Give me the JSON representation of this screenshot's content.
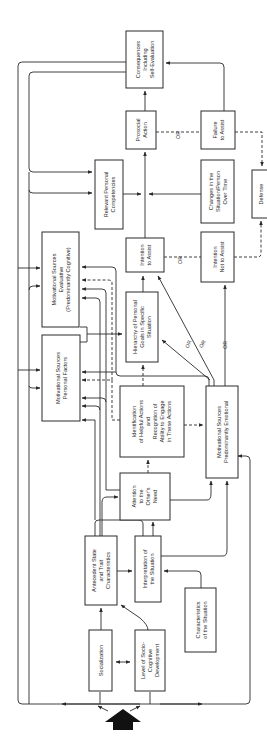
{
  "diagram": {
    "orientation": "rotated 90 degrees (text reads bottom-to-top)",
    "boxes": {
      "consequences": [
        "Consequences",
        "Including",
        "Self-Evaluation"
      ],
      "prosocial_action": [
        "Prosocial",
        "Action"
      ],
      "failure_to_assist": [
        "Failure",
        "to Assist"
      ],
      "relevant_competencies": [
        "Relevant Personal",
        "Competencies"
      ],
      "changes_situation": [
        "Changes in the",
        "Situation/Person",
        "Over Time"
      ],
      "defense": [
        "Defense"
      ],
      "motivational_evaluative": [
        "Motivational Sources",
        "Evaluative",
        "(Predominantly Cognitive)"
      ],
      "intention_to_assist": [
        "Intention",
        "to Assist"
      ],
      "intention_not_to_assist": [
        "Intention",
        "Not to Assist"
      ],
      "hierarchy_goals": [
        "Hierarchy of Personal",
        "Goals in Specific",
        "Situation"
      ],
      "motivational_personal": [
        "Motivational Sources",
        "Personal Factors"
      ],
      "identification_actions": [
        "Identification",
        "of Helpful Actions",
        "and",
        "Recognition of",
        "Ability to Engage",
        "in These Actions"
      ],
      "motivational_emotional": [
        "Motivational Sources",
        "Predominantly Emotional"
      ],
      "attention_need": [
        "Attention",
        "to the",
        "Other's",
        "Need"
      ],
      "antecedent_state": [
        "Antecedent State",
        "and Trait",
        "Characteristics"
      ],
      "interpretation_situation": [
        "Interpretation of",
        "the Situation"
      ],
      "characteristics_situation": [
        "Characteristics",
        "of the Situation"
      ],
      "socialization": [
        "Socialization"
      ],
      "socio_cognitive": [
        "Level of Socio-",
        "Cognitive",
        "Development"
      ]
    },
    "connector_labels": {
      "or_action": "OR",
      "or_intention": "OR",
      "or_goal_1": "OR",
      "or_goal_2": "OR",
      "or_emotional": "OR"
    }
  }
}
